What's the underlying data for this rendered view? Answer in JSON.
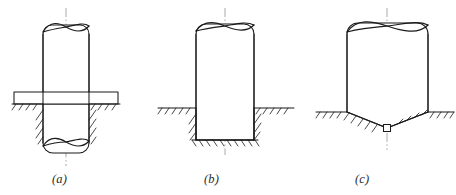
{
  "figure": {
    "kind": "engineering-line-drawing",
    "panel_count": 3,
    "captions": {
      "a": "(a)",
      "b": "(b)",
      "c": "(c)"
    },
    "colors": {
      "outline": "#1a1a1a",
      "centerline": "#8a8a8a",
      "hatch": "#1a1a1a",
      "background": "#ffffff",
      "caption": "#2b2b2b"
    },
    "panels": [
      {
        "id": "a",
        "caption": "(a)",
        "support_type": "collar-plate-at-grade",
        "column": {
          "left": 43,
          "right": 89,
          "top": 22,
          "bottom": 158,
          "width": 46
        },
        "centerline": {
          "x": 66,
          "top": 8,
          "bottom": 166
        },
        "plate": {
          "left": 14,
          "right": 118,
          "top": 92,
          "bottom": 104
        },
        "ground": {
          "y": 104,
          "left_start": 14,
          "left_end": 43,
          "right_start": 89,
          "right_end": 118
        },
        "breaks": [
          {
            "position": "top",
            "y": 26
          },
          {
            "position": "bottom",
            "y": 152
          }
        ]
      },
      {
        "id": "b",
        "caption": "(b)",
        "support_type": "flat-bearing-in-rectangular-pit",
        "column": {
          "left": 196,
          "right": 254,
          "top": 22,
          "bottom": 140,
          "width": 58
        },
        "centerline": {
          "x": 225,
          "top": 8,
          "bottom": 155
        },
        "pit": {
          "left": 196,
          "right": 254,
          "top": 108,
          "bottom": 140
        },
        "ground": {
          "y": 108,
          "left_start": 160,
          "left_end": 196,
          "right_start": 254,
          "right_end": 292
        },
        "breaks": [
          {
            "position": "top",
            "y": 26
          }
        ]
      },
      {
        "id": "c",
        "caption": "(c)",
        "support_type": "conical-point-bearing",
        "column": {
          "left": 347,
          "right": 428,
          "top": 22,
          "bottom": 112,
          "width": 81
        },
        "centerline": {
          "x": 387,
          "top": 8,
          "bottom": 150
        },
        "point": {
          "apex_x": 387,
          "apex_y": 128,
          "shoulder_y": 112
        },
        "ground": {
          "y": 112,
          "left_start": 318,
          "left_end": 347,
          "right_start": 428,
          "right_end": 452
        },
        "tip_marker": {
          "x": 387,
          "y": 128,
          "size": 7,
          "shape": "square"
        },
        "breaks": [
          {
            "position": "top",
            "y": 26
          }
        ]
      }
    ]
  }
}
